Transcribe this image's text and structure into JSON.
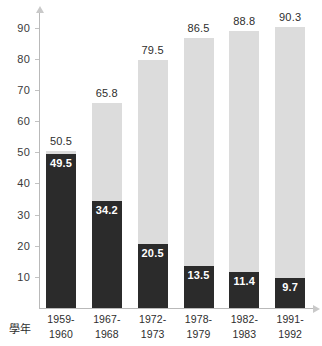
{
  "chart_data": {
    "type": "bar",
    "title": "",
    "subtitle": "",
    "xlabel": "學年",
    "ylabel": "",
    "ylim": [
      0,
      95
    ],
    "grid": false,
    "legend": null,
    "stacked": true,
    "categories": [
      "1959-\n1960",
      "1967-\n1968",
      "1972-\n1973",
      "1978-\n1979",
      "1982-\n1983",
      "1991-\n1992"
    ],
    "category_lines": [
      [
        "1959-",
        "1960"
      ],
      [
        "1967-",
        "1968"
      ],
      [
        "1972-",
        "1973"
      ],
      [
        "1978-",
        "1979"
      ],
      [
        "1982-",
        "1983"
      ],
      [
        "1991-",
        "1992"
      ]
    ],
    "yticks": [
      10,
      20,
      30,
      40,
      50,
      60,
      70,
      80,
      90
    ],
    "ytick_labels": [
      "10",
      "20",
      "30",
      "40",
      "50",
      "60",
      "70",
      "80",
      "90"
    ],
    "series": [
      {
        "name": "dark-segment",
        "color": "#2b2b2b",
        "label_color": "#ffffff",
        "values": [
          49.5,
          34.2,
          20.5,
          13.5,
          11.4,
          9.7
        ],
        "value_labels": [
          "49.5",
          "34.2",
          "20.5",
          "13.5",
          "11.4",
          "9.7"
        ]
      },
      {
        "name": "light-segment-total",
        "color": "#dcdcdc",
        "label_color": "#2e2e2e",
        "values": [
          50.5,
          65.8,
          79.5,
          86.5,
          88.8,
          90.3
        ],
        "value_labels": [
          "50.5",
          "65.8",
          "79.5",
          "86.5",
          "88.8",
          "90.3"
        ]
      }
    ]
  },
  "axis": {
    "caption": "學年"
  },
  "colors": {
    "dark": "#2b2b2b",
    "light": "#dcdcdc",
    "axis": "#b9b9b9",
    "text": "#2e2e2e",
    "label_on_dark": "#ffffff"
  }
}
